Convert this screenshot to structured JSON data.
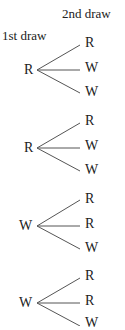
{
  "headers": {
    "first": "1st draw",
    "second": "2nd draw"
  },
  "tree": [
    {
      "root": "R",
      "leaves": [
        "R",
        "W",
        "W"
      ]
    },
    {
      "root": "R",
      "leaves": [
        "R",
        "W",
        "W"
      ]
    },
    {
      "root": "W",
      "leaves": [
        "R",
        "R",
        "W"
      ]
    },
    {
      "root": "W",
      "leaves": [
        "R",
        "R",
        "W"
      ]
    }
  ],
  "colors": {
    "ink": "#222222",
    "line": "#555555"
  }
}
